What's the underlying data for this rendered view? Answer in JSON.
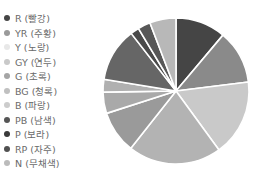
{
  "chart_data": {
    "type": "pie",
    "title": "",
    "start_angle_deg": 0,
    "direction": "clockwise",
    "legend_position": "left",
    "categories": [
      "R (빨강)",
      "YR (주황)",
      "Y (노랑)",
      "GY (연두)",
      "G (초록)",
      "BG (청록)",
      "B (파랑)",
      "PB (남색)",
      "P (보라)",
      "RP (자주)",
      "N (무채색)"
    ],
    "values": [
      11.1,
      11.9,
      16.9,
      20.6,
      9.4,
      4.7,
      2.8,
      11.9,
      1.9,
      2.8,
      5.8
    ],
    "colors": [
      "#454545",
      "#8a8a8a",
      "#c9c9c9",
      "#b3b3b3",
      "#9a9a9a",
      "#a9a9a9",
      "#b0b0b0",
      "#666666",
      "#4a4a4a",
      "#575757",
      "#b8b8b8"
    ]
  },
  "legend": {
    "items": [
      {
        "label": "R (빨강)",
        "color": "#454545"
      },
      {
        "label": "YR (주황)",
        "color": "#9a9a9a"
      },
      {
        "label": "Y (노랑)",
        "color": "#e8e8e8"
      },
      {
        "label": "GY (연두)",
        "color": "#c9c9c9"
      },
      {
        "label": "G (초록)",
        "color": "#a5a5a5"
      },
      {
        "label": "BG (청록)",
        "color": "#c0c0c0"
      },
      {
        "label": "B (파랑)",
        "color": "#cccccc"
      },
      {
        "label": "PB (남색)",
        "color": "#555555"
      },
      {
        "label": "P (보라)",
        "color": "#3a3a3a"
      },
      {
        "label": "RP (자주)",
        "color": "#505050"
      },
      {
        "label": "N (무채색)",
        "color": "#bbbbbb"
      }
    ]
  }
}
